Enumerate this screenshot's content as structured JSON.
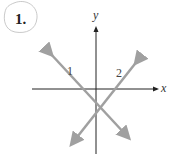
{
  "problem": {
    "number": "1."
  },
  "axes": {
    "x_label": "x",
    "y_label": "y"
  },
  "lines": [
    {
      "label": "1",
      "slope": "negative",
      "color": "#a0a0a0"
    },
    {
      "label": "2",
      "slope": "positive",
      "color": "#a0a0a0"
    }
  ],
  "colors": {
    "axis": "#222222",
    "line": "#a0a0a0",
    "circle": "#bbbbbb"
  }
}
